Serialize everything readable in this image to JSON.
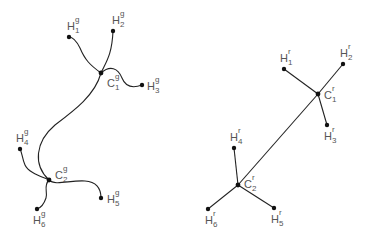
{
  "diagram": {
    "left": {
      "superscript": "g",
      "atoms": [
        {
          "id": "C1",
          "element": "C",
          "index": "1",
          "x": 101,
          "y": 73,
          "lx": 107,
          "ly": 78
        },
        {
          "id": "C2",
          "element": "C",
          "index": "2",
          "x": 49,
          "y": 180,
          "lx": 55,
          "ly": 170
        },
        {
          "id": "H1",
          "element": "H",
          "index": "1",
          "x": 69,
          "y": 37,
          "lx": 67,
          "ly": 21
        },
        {
          "id": "H2",
          "element": "H",
          "index": "2",
          "x": 113,
          "y": 31,
          "lx": 112,
          "ly": 15
        },
        {
          "id": "H3",
          "element": "H",
          "index": "3",
          "x": 142,
          "y": 85,
          "lx": 147,
          "ly": 81
        },
        {
          "id": "H4",
          "element": "H",
          "index": "4",
          "x": 20,
          "y": 149,
          "lx": 16,
          "ly": 133
        },
        {
          "id": "H5",
          "element": "H",
          "index": "5",
          "x": 101,
          "y": 198,
          "lx": 107,
          "ly": 194
        },
        {
          "id": "H6",
          "element": "H",
          "index": "6",
          "x": 37,
          "y": 209,
          "lx": 33,
          "ly": 215
        }
      ],
      "bonds": [
        {
          "from": "C1",
          "to": "C2",
          "path": "M101,73 C95,95 75,110 55,125 C35,142 33,165 49,180"
        },
        {
          "from": "C1",
          "to": "H1",
          "path": "M101,73 C90,65 85,60 80,48 C76,40 72,37 69,37"
        },
        {
          "from": "C1",
          "to": "H2",
          "path": "M101,73 C106,62 112,55 113,31"
        },
        {
          "from": "C1",
          "to": "H3",
          "path": "M101,73 C110,65 118,68 122,78 C126,88 134,88 142,85"
        },
        {
          "from": "C2",
          "to": "H4",
          "path": "M49,180 C40,176 28,172 25,165 C22,158 22,152 20,149"
        },
        {
          "from": "C2",
          "to": "H5",
          "path": "M49,180 C55,186 70,180 85,181 C98,182 101,190 101,198"
        },
        {
          "from": "C2",
          "to": "H6",
          "path": "M49,180 C43,186 48,192 46,198 C44,204 40,208 37,209"
        }
      ]
    },
    "right": {
      "superscript": "r",
      "atoms": [
        {
          "id": "C1",
          "element": "C",
          "index": "1",
          "x": 318,
          "y": 94,
          "lx": 324,
          "ly": 90
        },
        {
          "id": "C2",
          "element": "C",
          "index": "2",
          "x": 238,
          "y": 185,
          "lx": 244,
          "ly": 179
        },
        {
          "id": "H1",
          "element": "H",
          "index": "1",
          "x": 284,
          "y": 69,
          "lx": 280,
          "ly": 53
        },
        {
          "id": "H2",
          "element": "H",
          "index": "2",
          "x": 343,
          "y": 64,
          "lx": 340,
          "ly": 48
        },
        {
          "id": "H3",
          "element": "H",
          "index": "3",
          "x": 327,
          "y": 125,
          "lx": 324,
          "ly": 131
        },
        {
          "id": "H4",
          "element": "H",
          "index": "4",
          "x": 234,
          "y": 148,
          "lx": 230,
          "ly": 132
        },
        {
          "id": "H5",
          "element": "H",
          "index": "5",
          "x": 274,
          "y": 208,
          "lx": 271,
          "ly": 214
        },
        {
          "id": "H6",
          "element": "H",
          "index": "6",
          "x": 208,
          "y": 209,
          "lx": 205,
          "ly": 215
        }
      ],
      "bonds": [
        {
          "from": "C1",
          "to": "C2"
        },
        {
          "from": "C1",
          "to": "H1"
        },
        {
          "from": "C1",
          "to": "H2"
        },
        {
          "from": "C1",
          "to": "H3"
        },
        {
          "from": "C2",
          "to": "H4"
        },
        {
          "from": "C2",
          "to": "H5"
        },
        {
          "from": "C2",
          "to": "H6"
        }
      ]
    },
    "colors": {
      "line": "#222222",
      "dot": "#111111",
      "label": "#555555"
    }
  }
}
